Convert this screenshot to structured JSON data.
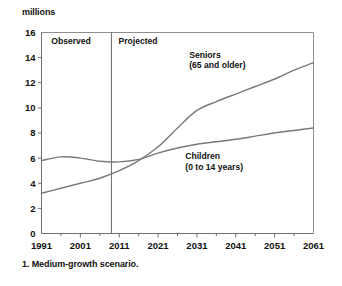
{
  "chart_data": {
    "type": "line",
    "title": "",
    "subtitle": "",
    "unit_label": "millions",
    "xlabel": "",
    "ylabel": "millions",
    "xlim": [
      1991,
      2061
    ],
    "ylim": [
      0,
      16
    ],
    "ytick_step": 2,
    "grid": false,
    "legend_position": "inline-annotations",
    "footnote": "1. Medium-growth scenario.",
    "yticks": [
      "0",
      "2",
      "4",
      "6",
      "8",
      "10",
      "12",
      "14",
      "16"
    ],
    "ytick_values": [
      0,
      2,
      4,
      6,
      8,
      10,
      12,
      14,
      16
    ],
    "xticks": [
      "1991",
      "2001",
      "2011",
      "2021",
      "2031",
      "2041",
      "2051",
      "2061"
    ],
    "xtick_values": [
      1991,
      2001,
      2011,
      2021,
      2031,
      2041,
      2051,
      2061
    ],
    "xtick_minor_values": [
      1996,
      2006,
      2016,
      2026,
      2036,
      2046,
      2056
    ],
    "zones": [
      {
        "label": "Observed",
        "start": 1991,
        "end": 2009
      },
      {
        "label": "Projected",
        "start": 2009,
        "end": 2061
      }
    ],
    "divider_x": 2009,
    "annotations": [
      {
        "name": "seniors-label",
        "line1": "Seniors",
        "line2": "(65 and older)",
        "x": 2029,
        "y": 14.0
      },
      {
        "name": "children-label",
        "line1": "Children",
        "line2": "(0 to 14 years)",
        "x": 2028,
        "y": 5.9
      }
    ],
    "series": [
      {
        "name": "Seniors (65 and older)",
        "color": "#7a7a7a",
        "x": [
          1991,
          1996,
          2001,
          2006,
          2011,
          2016,
          2021,
          2026,
          2031,
          2036,
          2041,
          2046,
          2051,
          2056,
          2061
        ],
        "values": [
          3.2,
          3.6,
          4.0,
          4.4,
          5.0,
          5.8,
          6.9,
          8.4,
          9.8,
          10.5,
          11.1,
          11.7,
          12.3,
          13.0,
          13.6
        ]
      },
      {
        "name": "Children (0 to 14 years)",
        "color": "#7a7a7a",
        "x": [
          1991,
          1996,
          2001,
          2006,
          2011,
          2016,
          2021,
          2026,
          2031,
          2036,
          2041,
          2046,
          2051,
          2056,
          2061
        ],
        "values": [
          5.8,
          6.1,
          6.0,
          5.75,
          5.7,
          5.9,
          6.4,
          6.8,
          7.1,
          7.3,
          7.5,
          7.75,
          8.0,
          8.2,
          8.4
        ]
      }
    ]
  }
}
